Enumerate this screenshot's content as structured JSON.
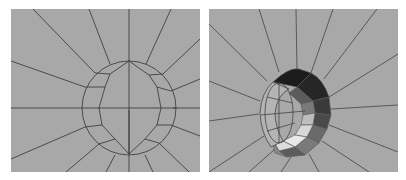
{
  "figure": {
    "panels": [
      {
        "id": "left",
        "description": "Flat radial quad mesh around an elliptical hole (wireframe)",
        "background": "#a8a8a8",
        "line_color": "#333333"
      },
      {
        "id": "right",
        "description": "Same radial mesh with the hole extruded into a shaded tube/crescent",
        "background": "#a8a8a8",
        "line_color": "#444444",
        "shade_colors": [
          "#1c1c1c",
          "#3a3a3a",
          "#5c5c5c",
          "#7a7a7a",
          "#9a9a9a",
          "#bdbdbd",
          "#d8d8d8",
          "#e8e8e8"
        ]
      }
    ]
  }
}
